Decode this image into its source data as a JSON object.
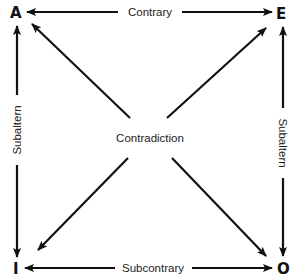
{
  "diagram": {
    "corners": {
      "top_left": "A",
      "top_right": "E",
      "bottom_left": "I",
      "bottom_right": "O"
    },
    "relations": {
      "top": "Contrary",
      "bottom": "Subcontrary",
      "left": "Subaltern",
      "right": "Subaltern",
      "diagonal": "Contradiction"
    },
    "colors": {
      "line": "#111111",
      "text": "#222222",
      "background": "#ffffff"
    }
  }
}
